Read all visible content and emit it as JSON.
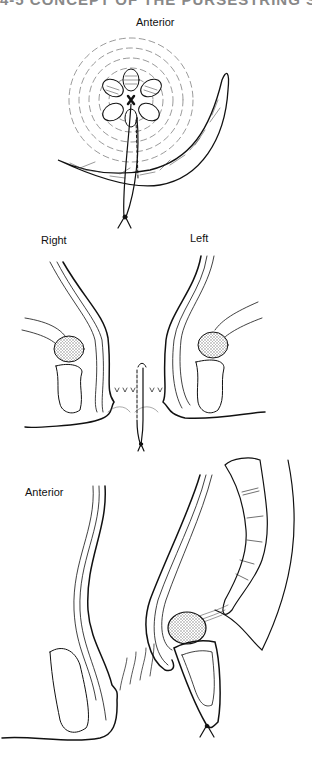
{
  "page": {
    "heading_fragment": "4-5   CONCEPT OF THE PURSESTRING STITCH"
  },
  "figure": {
    "panels": [
      {
        "id": "top-view",
        "label": "Anterior",
        "description": "Perineal view of anal opening with radial folds, crescent muscle sling, suture tied below"
      },
      {
        "id": "coronal-view",
        "labels": {
          "right": "Right",
          "left": "Left"
        },
        "description": "Coronal section showing anal canal walls, stippled muscle bodies, and suture through midline"
      },
      {
        "id": "sagittal-view",
        "label": "Anterior",
        "description": "Sagittal section showing rectum, stippled puborectalis, and knotted suture"
      }
    ],
    "colors": {
      "ink": "#111111",
      "stipple": "#bbbbbb",
      "background": "#ffffff"
    }
  }
}
